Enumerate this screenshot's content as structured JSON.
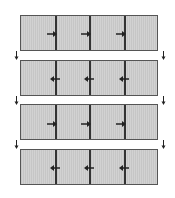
{
  "diagram": {
    "type": "sequence of segmented panels",
    "colors": {
      "panel_fill": "#cccccc",
      "border": "#555555",
      "divider": "#333333",
      "arrow": "#222222"
    },
    "panels": [
      {
        "index": 1,
        "segments": 4,
        "arrow_direction": "right",
        "arrows": 3
      },
      {
        "index": 2,
        "segments": 4,
        "arrow_direction": "left",
        "arrows": 3
      },
      {
        "index": 3,
        "segments": 4,
        "arrow_direction": "right",
        "arrows": 3
      },
      {
        "index": 4,
        "segments": 4,
        "arrow_direction": "left",
        "arrows": 3
      }
    ],
    "transitions": [
      {
        "from": 1,
        "to": 2,
        "icon": "down-arrow-icon"
      },
      {
        "from": 2,
        "to": 3,
        "icon": "down-arrow-icon"
      },
      {
        "from": 3,
        "to": 4,
        "icon": "down-arrow-icon"
      }
    ]
  }
}
